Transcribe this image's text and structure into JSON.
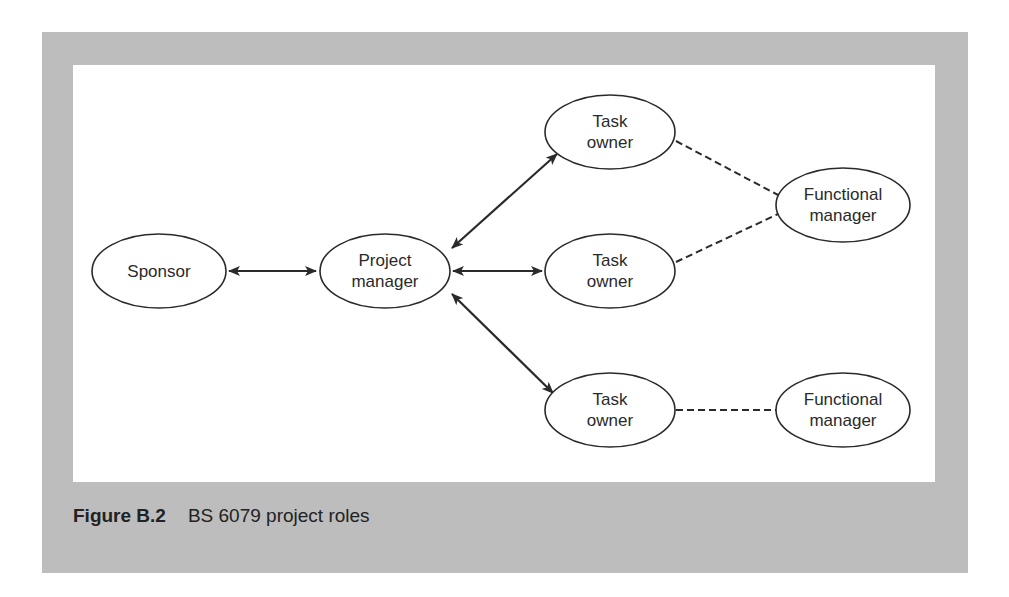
{
  "figure": {
    "caption_label": "Figure B.2",
    "caption_title": "BS 6079 project roles"
  },
  "nodes": {
    "sponsor": {
      "line1": "Sponsor"
    },
    "project_manager": {
      "line1": "Project",
      "line2": "manager"
    },
    "task_owner_1": {
      "line1": "Task",
      "line2": "owner"
    },
    "task_owner_2": {
      "line1": "Task",
      "line2": "owner"
    },
    "task_owner_3": {
      "line1": "Task",
      "line2": "owner"
    },
    "functional_manager_1": {
      "line1": "Functional",
      "line2": "manager"
    },
    "functional_manager_2": {
      "line1": "Functional",
      "line2": "manager"
    }
  },
  "edges": [
    {
      "from": "Sponsor",
      "to": "Project manager",
      "style": "solid",
      "arrows": "both"
    },
    {
      "from": "Project manager",
      "to": "Task owner (top)",
      "style": "solid",
      "arrows": "both"
    },
    {
      "from": "Project manager",
      "to": "Task owner (middle)",
      "style": "solid",
      "arrows": "both"
    },
    {
      "from": "Project manager",
      "to": "Task owner (bottom)",
      "style": "solid",
      "arrows": "both"
    },
    {
      "from": "Task owner (top)",
      "to": "Functional manager (upper)",
      "style": "dashed",
      "arrows": "none"
    },
    {
      "from": "Task owner (middle)",
      "to": "Functional manager (upper)",
      "style": "dashed",
      "arrows": "none"
    },
    {
      "from": "Task owner (bottom)",
      "to": "Functional manager (lower)",
      "style": "dashed",
      "arrows": "none"
    }
  ],
  "colors": {
    "frame": "#bdbdbd",
    "canvas": "#ffffff",
    "stroke": "#2a2a2a"
  }
}
